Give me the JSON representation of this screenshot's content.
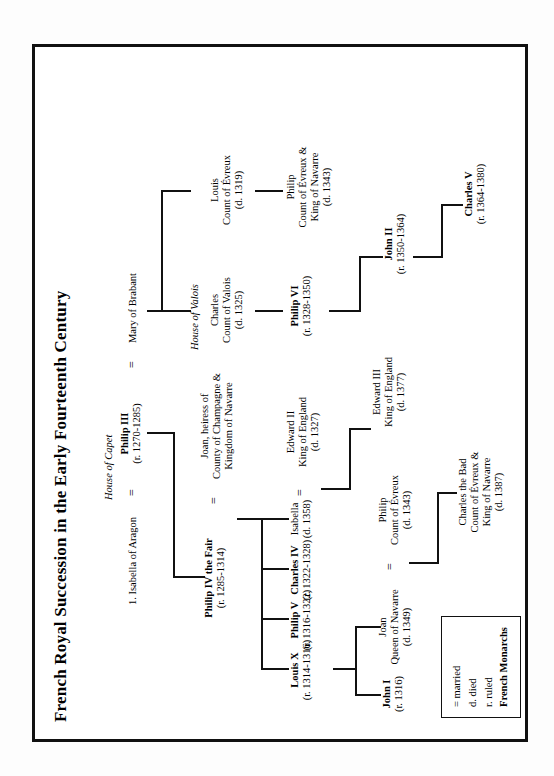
{
  "figure": {
    "title": "French Royal Succession in the Early Fourteenth Century",
    "houses": {
      "capet": "House of Capet",
      "valois": "House of Valois"
    }
  },
  "legend": {
    "married": "= married",
    "died": "d. died",
    "ruled": "r. ruled",
    "monarchs": "French Monarchs"
  },
  "symbols": {
    "marriage": "="
  },
  "people": {
    "isabella_aragon": {
      "name": "1. Isabella of Aragon",
      "line2": "",
      "dates": ""
    },
    "philip_iii": {
      "name": "Philip III",
      "line2": "",
      "dates": "(r. 1270-1285)"
    },
    "mary_brabant": {
      "name": "Mary of Brabant",
      "line2": "",
      "dates": ""
    },
    "philip_iv": {
      "name": "Philip IV the Fair",
      "line2": "",
      "dates": "(r. 1285-1314)"
    },
    "joan_navarre_heiress": {
      "name": "Joan, heiress of",
      "line2": "County of Champagne &",
      "line3": "Kingdom of Navarre",
      "dates": ""
    },
    "louis_x": {
      "name": "Louis X",
      "line2": "",
      "dates": "(r. 1314-1316)"
    },
    "philip_v": {
      "name": "Philip V",
      "line2": "",
      "dates": "(r. 1316-1322)"
    },
    "charles_iv": {
      "name": "Charles IV",
      "line2": "",
      "dates": "(r. 1322-1328)"
    },
    "isabella": {
      "name": "Isabella",
      "line2": "",
      "dates": "(d. 1358)"
    },
    "edward_ii": {
      "name": "Edward II",
      "line2": "King of England",
      "dates": "(d. 1327)"
    },
    "edward_iii": {
      "name": "Edward III",
      "line2": "King of England",
      "dates": "(d. 1377)"
    },
    "john_i": {
      "name": "John I",
      "line2": "",
      "dates": "(r. 1316)"
    },
    "joan_queen_navarre": {
      "name": "Joan",
      "line2": "Queen of Navarre",
      "dates": "(d. 1349)"
    },
    "philip_evreux": {
      "name": "Philip",
      "line2": "Count of Évreux",
      "dates": "(d. 1343)"
    },
    "charles_bad": {
      "name": "Charles the Bad",
      "line2": "Count of Évreux &",
      "line3": "King of Navarre",
      "dates": "(d. 1387)"
    },
    "charles_valois": {
      "name": "Charles",
      "line2": "Count of Valois",
      "dates": "(d. 1325)"
    },
    "philip_vi": {
      "name": "Philip VI",
      "line2": "",
      "dates": "(r. 1328-1350)"
    },
    "john_ii": {
      "name": "John II",
      "line2": "",
      "dates": "(r. 1350-1364)"
    },
    "charles_v": {
      "name": "Charles V",
      "line2": "",
      "dates": "(r. 1364-1380)"
    },
    "louis_evreux": {
      "name": "Louis",
      "line2": "Count of Évreux",
      "dates": "(d. 1319)"
    },
    "philip_evreux_navarre": {
      "name": "Philip",
      "line2": "Count of Évreux &",
      "line3": "King of Navarre",
      "dates": "(d. 1343)"
    }
  }
}
